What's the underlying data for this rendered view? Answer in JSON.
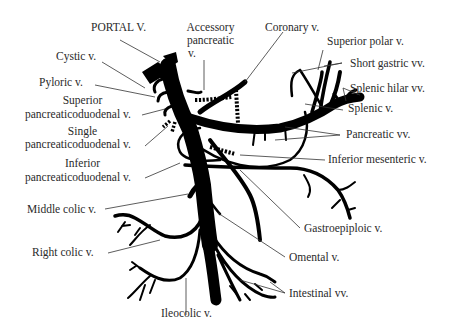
{
  "diagram": {
    "labels": {
      "portal": "PORTAL V.",
      "accessory_1": "Accessory",
      "accessory_2": "pancreatic",
      "accessory_3": "v.",
      "coronary": "Coronary v.",
      "superior_polar": "Superior polar v.",
      "cystic": "Cystic v.",
      "short_gastric": "Short gastric vv.",
      "pyloric": "Pyloric v.",
      "splenic_hilar": "Splenic hilar vv.",
      "sup_pd_1": "Superior",
      "sup_pd_2": "pancreaticoduodenal v.",
      "splenic": "Splenic v.",
      "single_pd_1": "Single",
      "single_pd_2": "pancreaticoduodenal v.",
      "pancreatic": "Pancreatic vv.",
      "inf_pd_1": "Inferior",
      "inf_pd_2": "pancreaticoduodenal v.",
      "inferior_mesenteric": "Inferior mesenteric v.",
      "middle_colic": "Middle colic v.",
      "gastroepiploic": "Gastroepiploic v.",
      "right_colic": "Right colic v.",
      "omental": "Omental v.",
      "intestinal": "Intestinal vv.",
      "ileocolic": "Ileocolic v."
    },
    "colors": {
      "vein": "#000000",
      "leader": "#333333",
      "text": "#2a2a2a",
      "background": "#ffffff"
    }
  }
}
